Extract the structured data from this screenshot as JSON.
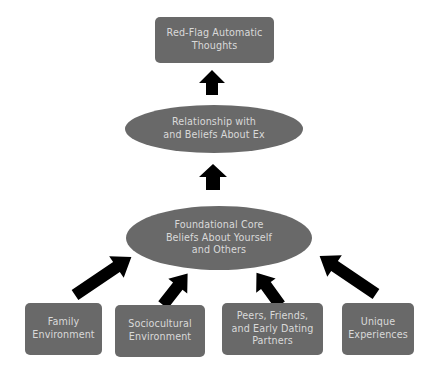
{
  "diagram": {
    "type": "flowchart",
    "colors": {
      "node_fill": "#696969",
      "node_text": "#d9d9d9",
      "arrow": "#000000",
      "background": "#ffffff"
    },
    "top_box": {
      "label": "Red-Flag Automatic Thoughts",
      "line1": "Red-Flag Automatic",
      "line2": "Thoughts"
    },
    "middle_ellipse": {
      "label": "Relationship with and Beliefs About Ex",
      "line1": "Relationship with",
      "line2": "and Beliefs About Ex"
    },
    "core_ellipse": {
      "label": "Foundational Core Beliefs About Yourself and Others",
      "line1": "Foundational Core",
      "line2": "Beliefs About Yourself",
      "line3": "and Others"
    },
    "sources": [
      {
        "label": "Family Environment",
        "line1": "Family",
        "line2": "Environment"
      },
      {
        "label": "Sociocultural Environment",
        "line1": "Sociocultural",
        "line2": "Environment"
      },
      {
        "label": "Peers, Friends, and Early Dating Partners",
        "line1": "Peers, Friends,",
        "line2": "and Early Dating",
        "line3": "Partners"
      },
      {
        "label": "Unique Experiences",
        "line1": "Unique",
        "line2": "Experiences"
      }
    ],
    "edges": [
      {
        "from": "Family Environment",
        "to": "Foundational Core Beliefs About Yourself and Others"
      },
      {
        "from": "Sociocultural Environment",
        "to": "Foundational Core Beliefs About Yourself and Others"
      },
      {
        "from": "Peers, Friends, and Early Dating Partners",
        "to": "Foundational Core Beliefs About Yourself and Others"
      },
      {
        "from": "Unique Experiences",
        "to": "Foundational Core Beliefs About Yourself and Others"
      },
      {
        "from": "Foundational Core Beliefs About Yourself and Others",
        "to": "Relationship with and Beliefs About Ex"
      },
      {
        "from": "Relationship with and Beliefs About Ex",
        "to": "Red-Flag Automatic Thoughts"
      }
    ]
  }
}
